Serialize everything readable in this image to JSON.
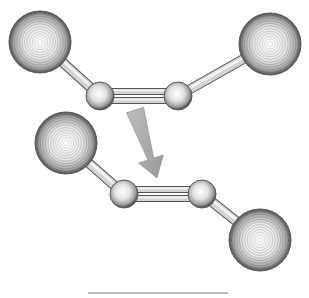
{
  "figure": {
    "type": "molecular-isomerization-diagram",
    "colors": {
      "background": "#ffffff",
      "sphere_light": "#ffffff",
      "sphere_mid": "#c8c8c8",
      "sphere_dark": "#5a5a5a",
      "bond": "#9a9a9a",
      "bond_edge": "#555555",
      "arrow": "#a8a8a8",
      "baseline": "#777777"
    },
    "molecules": [
      {
        "name": "upper-molecule",
        "atoms": [
          {
            "id": "a1",
            "kind": "large",
            "cx": 40,
            "cy": 42,
            "r": 31
          },
          {
            "id": "a2",
            "kind": "small",
            "cx": 100,
            "cy": 96,
            "r": 14
          },
          {
            "id": "a3",
            "kind": "small",
            "cx": 178,
            "cy": 96,
            "r": 14
          },
          {
            "id": "a4",
            "kind": "large",
            "cx": 270,
            "cy": 44,
            "r": 31
          }
        ],
        "bonds": [
          {
            "from": "a1",
            "to": "a2",
            "order": 1
          },
          {
            "from": "a2",
            "to": "a3",
            "order": 2
          },
          {
            "from": "a3",
            "to": "a4",
            "order": 1
          }
        ]
      },
      {
        "name": "lower-molecule",
        "atoms": [
          {
            "id": "b1",
            "kind": "large",
            "cx": 66,
            "cy": 143,
            "r": 31
          },
          {
            "id": "b2",
            "kind": "small",
            "cx": 124,
            "cy": 194,
            "r": 14
          },
          {
            "id": "b3",
            "kind": "small",
            "cx": 202,
            "cy": 194,
            "r": 14
          },
          {
            "id": "b4",
            "kind": "large",
            "cx": 260,
            "cy": 240,
            "r": 31
          }
        ],
        "bonds": [
          {
            "from": "b1",
            "to": "b2",
            "order": 1
          },
          {
            "from": "b2",
            "to": "b3",
            "order": 2
          },
          {
            "from": "b3",
            "to": "b4",
            "order": 1
          }
        ]
      }
    ],
    "arrow": {
      "x1": 135,
      "y1": 110,
      "x2": 157,
      "y2": 178
    },
    "baseline": {
      "x1": 88,
      "y1": 293,
      "x2": 228,
      "y2": 293
    }
  }
}
